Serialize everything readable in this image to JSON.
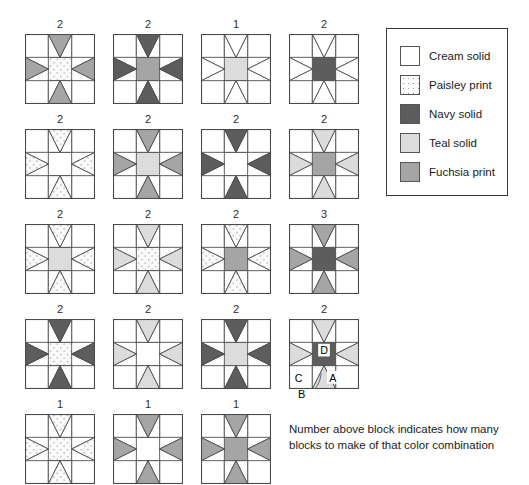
{
  "palette": {
    "cream": "#ffffff",
    "paisley": "#fbfbfb",
    "navy": "#5d5d5d",
    "teal": "#dcdcdc",
    "fuchsia": "#a5a5a5",
    "outline": "#4a4a4a",
    "paisley_dot": "#9a9a9a"
  },
  "legend": {
    "title": "Fabric key",
    "items": [
      {
        "swatch": "cream",
        "label": "Cream solid"
      },
      {
        "swatch": "paisley",
        "label": "Paisley print"
      },
      {
        "swatch": "navy",
        "label": "Navy solid"
      },
      {
        "swatch": "teal",
        "label": "Teal solid"
      },
      {
        "swatch": "fuchsia",
        "label": "Fuchsia print"
      }
    ]
  },
  "caption": {
    "line1": "Number above block indicates how many",
    "line2": "blocks to make of that color combination"
  },
  "callouts": {
    "a": "A",
    "b": "B",
    "c": "C",
    "d": "D"
  },
  "chart_data": {
    "type": "table",
    "rows": [
      [
        {
          "count": "2",
          "points": "fuchsia",
          "center": "paisley",
          "background": "cream",
          "corners": "cream",
          "labeled": false
        },
        {
          "count": "2",
          "points": "navy",
          "center": "fuchsia",
          "background": "cream",
          "corners": "cream",
          "labeled": false
        },
        {
          "count": "1",
          "points": "cream",
          "center": "teal",
          "background": "cream",
          "corners": "cream",
          "labeled": false
        },
        {
          "count": "2",
          "points": "cream",
          "center": "navy",
          "background": "cream",
          "corners": "cream",
          "labeled": false
        }
      ],
      [
        {
          "count": "2",
          "points": "paisley",
          "center": "cream",
          "background": "cream",
          "corners": "cream",
          "labeled": false
        },
        {
          "count": "2",
          "points": "fuchsia",
          "center": "teal",
          "background": "cream",
          "corners": "cream",
          "labeled": false
        },
        {
          "count": "2",
          "points": "navy",
          "center": "cream",
          "background": "cream",
          "corners": "cream",
          "labeled": false
        },
        {
          "count": "2",
          "points": "teal",
          "center": "fuchsia",
          "background": "cream",
          "corners": "cream",
          "labeled": false
        }
      ],
      [
        {
          "count": "2",
          "points": "paisley",
          "center": "teal",
          "background": "cream",
          "corners": "cream",
          "labeled": false
        },
        {
          "count": "2",
          "points": "teal",
          "center": "paisley",
          "background": "cream",
          "corners": "cream",
          "labeled": false
        },
        {
          "count": "2",
          "points": "paisley",
          "center": "fuchsia",
          "background": "cream",
          "corners": "cream",
          "labeled": false
        },
        {
          "count": "3",
          "points": "fuchsia",
          "center": "navy",
          "background": "cream",
          "corners": "cream",
          "labeled": false
        }
      ],
      [
        {
          "count": "2",
          "points": "navy",
          "center": "paisley",
          "background": "cream",
          "corners": "cream",
          "labeled": false
        },
        {
          "count": "2",
          "points": "teal",
          "center": "cream",
          "background": "cream",
          "corners": "cream",
          "labeled": false
        },
        {
          "count": "2",
          "points": "navy",
          "center": "teal",
          "background": "cream",
          "corners": "cream",
          "labeled": false
        },
        {
          "count": "2",
          "points": "teal",
          "center": "navy",
          "background": "cream",
          "corners": "cream",
          "labeled": true
        }
      ],
      [
        {
          "count": "1",
          "points": "paisley",
          "center": "paisley",
          "background": "cream",
          "corners": "cream",
          "labeled": false
        },
        {
          "count": "1",
          "points": "fuchsia",
          "center": "cream",
          "background": "cream",
          "corners": "cream",
          "labeled": false
        },
        {
          "count": "1",
          "points": "fuchsia",
          "center": "fuchsia",
          "background": "cream",
          "corners": "cream",
          "labeled": false
        }
      ]
    ]
  }
}
